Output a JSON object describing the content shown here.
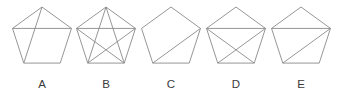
{
  "figure": {
    "canvas": {
      "width": 347,
      "height": 93
    },
    "background_color": "#ffffff",
    "stroke_color": "#8a8a8a",
    "label_color": "#3b3b3b",
    "shape_type": "regular-pentagon",
    "orientation": "apex-up",
    "vertex_order_note": "v0 = top apex, then clockwise: v1 = upper-right, v2 = lower-right, v3 = lower-left, v4 = upper-left",
    "items": [
      {
        "label": "A",
        "center_x": 42,
        "center_y": 38,
        "radius": 31,
        "label_x": 42,
        "label_y": 88,
        "diagonal_count": 2,
        "diagonals": [
          [
            4,
            1
          ],
          [
            0,
            3
          ]
        ],
        "diagonal_names": [
          "upper-left-to-upper-right",
          "apex-to-lower-left"
        ]
      },
      {
        "label": "B",
        "center_x": 106,
        "center_y": 38,
        "radius": 31,
        "label_x": 106,
        "label_y": 88,
        "diagonal_count": 5,
        "diagonals": [
          [
            0,
            2
          ],
          [
            0,
            3
          ],
          [
            1,
            3
          ],
          [
            1,
            4
          ],
          [
            2,
            4
          ]
        ],
        "diagonal_names": [
          "apex-to-lower-right",
          "apex-to-lower-left",
          "upper-right-to-lower-left",
          "upper-right-to-upper-left",
          "lower-right-to-upper-left"
        ]
      },
      {
        "label": "C",
        "center_x": 171,
        "center_y": 38,
        "radius": 31,
        "label_x": 171,
        "label_y": 88,
        "diagonal_count": 1,
        "diagonals": [
          [
            1,
            3
          ]
        ],
        "diagonal_names": [
          "upper-right-to-lower-left"
        ]
      },
      {
        "label": "D",
        "center_x": 236,
        "center_y": 38,
        "radius": 31,
        "label_x": 236,
        "label_y": 88,
        "diagonal_count": 3,
        "diagonals": [
          [
            4,
            1
          ],
          [
            1,
            3
          ],
          [
            4,
            2
          ]
        ],
        "diagonal_names": [
          "upper-left-to-upper-right",
          "upper-right-to-lower-left",
          "upper-left-to-lower-right"
        ]
      },
      {
        "label": "E",
        "center_x": 301,
        "center_y": 38,
        "radius": 31,
        "label_x": 301,
        "label_y": 88,
        "diagonal_count": 2,
        "diagonals": [
          [
            4,
            1
          ],
          [
            1,
            3
          ]
        ],
        "diagonal_names": [
          "upper-left-to-upper-right",
          "upper-right-to-lower-left"
        ]
      }
    ]
  }
}
